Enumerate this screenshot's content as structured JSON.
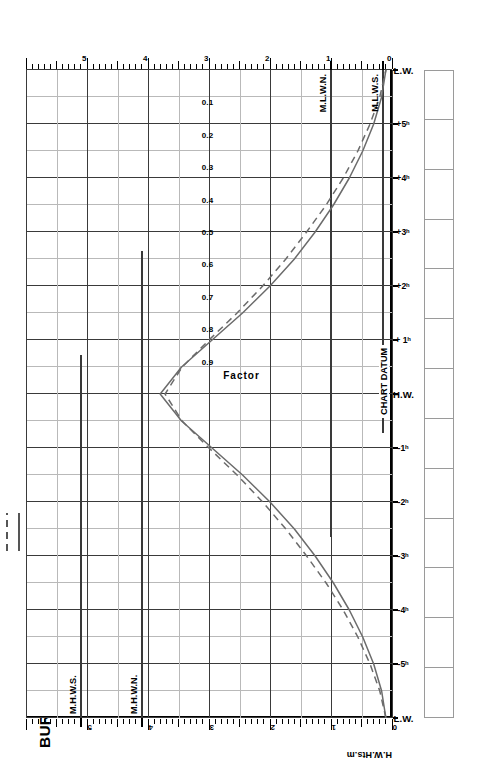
{
  "title": "BURNHAM-ON-CROUCH",
  "subtitle_lines": [
    "MEAN SPRING",
    "AND NEAP CURVES"
  ],
  "legend": {
    "header": "MEAN RANGES",
    "rows": [
      {
        "name": "Springs",
        "value": "5.0m",
        "style": "solid"
      },
      {
        "name": "Neaps",
        "value": "3.2m",
        "style": "dashed"
      }
    ]
  },
  "note_lines": [
    "Springs occur 2 days",
    "after",
    "New and Full Moon"
  ],
  "axes": {
    "height_left_label": "H.W.Hts.m",
    "height_right_label": "L.W.Hts.m",
    "height_ticks": [
      "0",
      "1",
      "2",
      "3",
      "4",
      "5"
    ],
    "time_labels": [
      "L.W.",
      "-5ʰ",
      "-4ʰ",
      "-3ʰ",
      "-2ʰ",
      "-1ʰ",
      "H.W.",
      "+ 1ʰ",
      "+2ʰ",
      "+3ʰ",
      "+4ʰ",
      "+5ʰ",
      "L.W."
    ],
    "factor_label": "Factor",
    "factor_ticks": [
      "0.9",
      "0.8",
      "0.7",
      "0.6",
      "0.5",
      "0.4",
      "0.3",
      "0.2",
      "0.1"
    ]
  },
  "datum_labels": {
    "mhws": "M.H.W.S.",
    "mhwn": "M.H.W.N.",
    "mlwn": "M.L.W.N.",
    "mlws": "M.L.W.S.",
    "chart_datum": "CHART DATUM"
  },
  "entry_boxes": [
    "",
    "",
    "",
    "",
    "",
    "",
    "",
    "",
    "",
    "",
    "",
    "",
    ""
  ],
  "colors": {
    "curve": "#6b6b6b",
    "grid_major": "#3a3a3a",
    "grid_minor": "#b9b9b9",
    "axis": "#000000",
    "paper": "#ffffff"
  },
  "chart_data": {
    "type": "line",
    "xlabel": "Time relative to High Water (hours)",
    "ylabel": "Height (m) / Factor",
    "xlim": [
      -6,
      6
    ],
    "ylim": [
      0,
      6
    ],
    "grid": true,
    "legend_position": "top-left",
    "x": [
      -6,
      -5.5,
      -5,
      -4.5,
      -4,
      -3.5,
      -3,
      -2.5,
      -2,
      -1.5,
      -1,
      -0.5,
      0,
      0.5,
      1,
      1.5,
      2,
      2.5,
      3,
      3.5,
      4,
      4.5,
      5,
      5.5,
      6
    ],
    "factor_axis": {
      "values": [
        1.0,
        0.9,
        0.8,
        0.7,
        0.6,
        0.5,
        0.4,
        0.3,
        0.2,
        0.1,
        0.0
      ],
      "note": "Factor 1.0 at H.W., 0.0 at L.W."
    },
    "series": [
      {
        "name": "Springs",
        "style": "solid",
        "mean_range": 5.0,
        "values": [
          0.1,
          0.17,
          0.3,
          0.48,
          0.7,
          0.96,
          1.26,
          1.6,
          2.0,
          2.45,
          2.95,
          3.45,
          3.8,
          3.45,
          2.95,
          2.45,
          2.0,
          1.6,
          1.26,
          0.96,
          0.7,
          0.48,
          0.3,
          0.17,
          0.1
        ]
      },
      {
        "name": "Neaps",
        "style": "dashed",
        "mean_range": 3.2,
        "values": [
          0.1,
          0.2,
          0.36,
          0.56,
          0.8,
          1.08,
          1.4,
          1.74,
          2.12,
          2.54,
          3.0,
          3.44,
          3.72,
          3.44,
          3.0,
          2.54,
          2.12,
          1.74,
          1.4,
          1.08,
          0.8,
          0.56,
          0.36,
          0.2,
          0.1
        ]
      }
    ],
    "reference_levels": [
      {
        "label": "M.H.W.S.",
        "value": 5.1,
        "axis": "H.W.Hts.m"
      },
      {
        "label": "M.H.W.N.",
        "value": 4.1,
        "axis": "H.W.Hts.m"
      },
      {
        "label": "M.L.W.N.",
        "value": 1.0,
        "axis": "L.W.Hts.m"
      },
      {
        "label": "M.L.W.S.",
        "value": 0.15,
        "axis": "L.W.Hts.m"
      },
      {
        "label": "CHART DATUM",
        "value": 0.0,
        "axis": "both"
      }
    ]
  }
}
